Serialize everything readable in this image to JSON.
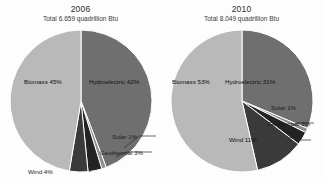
{
  "chart_data": [
    {
      "type": "pie",
      "title": "2006",
      "total_label": "Total",
      "total_value": "6.659 quadrillion Btu",
      "unit": "quadrillion Btu",
      "categories": [
        "Biomass",
        "Hydroelectric",
        "Wind",
        "Geothermal",
        "Solar"
      ],
      "values": [
        45,
        42,
        4,
        3,
        1
      ],
      "value_suffix": "%",
      "labels": [
        "Biomass 45%",
        "Hydroelectric 42%",
        "Wind 4%",
        "Geothermal 3%",
        "Solar 1%"
      ],
      "colors": [
        "#b9b9b9",
        "#6f6f6f",
        "#3a3a3a",
        "#232323",
        "#8f8f8f"
      ],
      "legend": "none",
      "grid": false
    },
    {
      "type": "pie",
      "title": "2010",
      "total_label": "Total",
      "total_value": "8.049 quadrillion Btu",
      "unit": "quadrillion Btu",
      "categories": [
        "Biomass",
        "Hydroelectric",
        "Wind",
        "Geothermal",
        "Solar"
      ],
      "values": [
        53,
        31,
        11,
        3,
        1
      ],
      "value_suffix": "%",
      "labels": [
        "Biomass 53%",
        "Hydroelectric 31%",
        "Wind 11%",
        "Geothermal 3%",
        "Solar 1%"
      ],
      "colors": [
        "#b9b9b9",
        "#6f6f6f",
        "#3a3a3a",
        "#232323",
        "#8f8f8f"
      ],
      "legend": "none",
      "grid": false
    }
  ],
  "chart2006": {
    "title": "2006",
    "total_label": "Total",
    "total_value": "6.659 quadrillion Btu",
    "labels": {
      "biomass": "Biomass 45%",
      "hydroelectric": "Hydroelectric 42%",
      "wind": "Wind 4%",
      "geothermal": "Geothermal 3%",
      "solar": "Solar 1%"
    }
  },
  "chart2010": {
    "title": "2010",
    "total_label": "Total",
    "total_value": "8.049 quadrillion Btu",
    "labels": {
      "biomass": "Biomass 53%",
      "hydroelectric": "Hydroelectric 31%",
      "wind": "Wind 11%",
      "geothermal": "Geothermal 3%",
      "solar": "Solar 1%"
    }
  },
  "palette": {
    "biomass": "#b9b9b9",
    "hydroelectric": "#6f6f6f",
    "wind": "#3a3a3a",
    "geothermal": "#232323",
    "solar": "#8f8f8f",
    "separator": "#ffffff",
    "background": "#fdfdfd"
  }
}
